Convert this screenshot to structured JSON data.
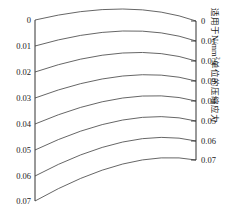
{
  "chart_data": {
    "type": "line",
    "title": "",
    "subtitle": "",
    "xlabel": "",
    "ylabel": "",
    "grid": false,
    "legend": "none",
    "left_axis": {
      "label": "",
      "tick_labels": [
        "0",
        "0.01",
        "0.02",
        "0.03",
        "0.04",
        "0.05",
        "0.06",
        "0.07"
      ],
      "values": [
        0,
        0.01,
        0.02,
        0.03,
        0.04,
        0.05,
        0.06,
        0.07
      ],
      "range": [
        0,
        0.07
      ],
      "pixel_y": [
        20,
        46,
        72,
        98,
        124,
        150,
        176,
        201
      ],
      "pixel_x": 35
    },
    "right_axis": {
      "label": "适用于N/mm²单位的压缩应力",
      "label_parts": {
        "prefix": "适用于N/mm",
        "superscript": "2",
        "suffix": "单位的压缩应力"
      },
      "tick_labels": [
        "0",
        "0.01",
        "0.02",
        "0.03",
        "0.04",
        "0.05",
        "0.06",
        "0.07"
      ],
      "values": [
        0,
        0.01,
        0.02,
        0.03,
        0.04,
        0.05,
        0.06,
        0.07
      ],
      "range": [
        0,
        0.07
      ],
      "pixel_y": [
        21,
        41,
        61,
        81,
        101,
        121,
        141,
        160
      ],
      "pixel_x": 196
    },
    "curves": [
      {
        "name": "isopleth-0.00",
        "left_value": 0,
        "right_value": 0,
        "start": [
          35,
          20
        ],
        "peak": [
          130,
          9
        ],
        "end": [
          196,
          21
        ]
      },
      {
        "name": "isopleth-0.01",
        "left_value": 0.01,
        "right_value": 0.01,
        "start": [
          35,
          46
        ],
        "peak": [
          130,
          31
        ],
        "end": [
          196,
          41
        ]
      },
      {
        "name": "isopleth-0.02",
        "left_value": 0.02,
        "right_value": 0.02,
        "start": [
          35,
          72
        ],
        "peak": [
          130,
          53
        ],
        "end": [
          196,
          61
        ]
      },
      {
        "name": "isopleth-0.03",
        "left_value": 0.03,
        "right_value": 0.03,
        "start": [
          35,
          98
        ],
        "peak": [
          130,
          76
        ],
        "end": [
          196,
          81
        ]
      },
      {
        "name": "isopleth-0.04",
        "left_value": 0.04,
        "right_value": 0.04,
        "start": [
          35,
          124
        ],
        "peak": [
          130,
          98
        ],
        "end": [
          196,
          101
        ]
      },
      {
        "name": "isopleth-0.05",
        "left_value": 0.05,
        "right_value": 0.05,
        "start": [
          35,
          150
        ],
        "peak": [
          130,
          120
        ],
        "end": [
          196,
          121
        ]
      },
      {
        "name": "isopleth-0.06",
        "left_value": 0.06,
        "right_value": 0.06,
        "start": [
          35,
          176
        ],
        "peak": [
          130,
          142
        ],
        "end": [
          196,
          141
        ]
      },
      {
        "name": "isopleth-0.07",
        "left_value": 0.07,
        "right_value": 0.07,
        "start": [
          35,
          201
        ],
        "peak": [
          130,
          164
        ],
        "end": [
          196,
          160
        ]
      }
    ],
    "colors": {
      "curve": "#555555",
      "axis": "#333333",
      "text": "#1a1a1a",
      "background": "#ffffff"
    }
  }
}
